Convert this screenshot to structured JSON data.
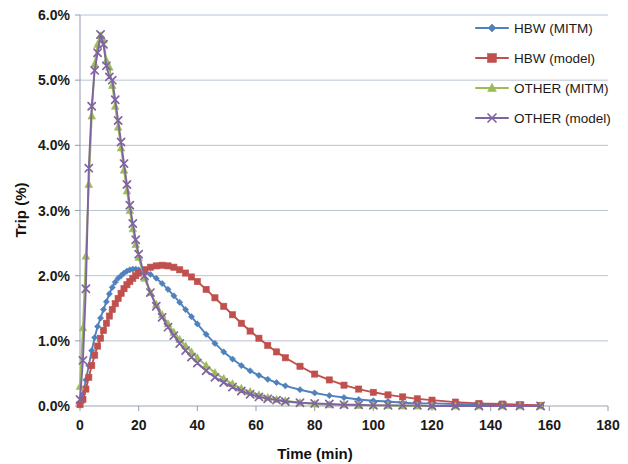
{
  "chart_data": {
    "type": "line",
    "title": "",
    "xlabel": "Time (min)",
    "ylabel": "Trip (%)",
    "xlim": [
      0,
      180
    ],
    "ylim": [
      0,
      6
    ],
    "xticks": [
      0,
      20,
      40,
      60,
      80,
      100,
      120,
      140,
      160,
      180
    ],
    "xtick_labels": [
      "0",
      "20",
      "40",
      "60",
      "80",
      "100",
      "120",
      "140",
      "160",
      "180"
    ],
    "yticks": [
      0,
      1,
      2,
      3,
      4,
      5,
      6
    ],
    "ytick_labels": [
      "0.0%",
      "1.0%",
      "2.0%",
      "3.0%",
      "4.0%",
      "5.0%",
      "6.0%"
    ],
    "grid": "horizontal",
    "legend_position": "top-right",
    "x_values": [
      0,
      1,
      2,
      3,
      4,
      5,
      6,
      7,
      8,
      9,
      10,
      11,
      12,
      13,
      14,
      15,
      16,
      17,
      18,
      19,
      20,
      22,
      24,
      26,
      28,
      30,
      32,
      34,
      36,
      38,
      40,
      43,
      46,
      49,
      52,
      55,
      58,
      61,
      64,
      67,
      70,
      75,
      80,
      85,
      90,
      95,
      100,
      105,
      110,
      115,
      120,
      128,
      136,
      144,
      150,
      157
    ],
    "series": [
      {
        "name": "HBW (MITM)",
        "color": "#4F81BD",
        "marker": "diamond",
        "values": [
          0.05,
          0.18,
          0.4,
          0.62,
          0.85,
          1.05,
          1.22,
          1.35,
          1.48,
          1.6,
          1.72,
          1.82,
          1.9,
          1.96,
          2.0,
          2.04,
          2.07,
          2.09,
          2.1,
          2.1,
          2.09,
          2.06,
          2.02,
          1.96,
          1.88,
          1.79,
          1.69,
          1.59,
          1.48,
          1.37,
          1.26,
          1.1,
          0.96,
          0.83,
          0.72,
          0.62,
          0.54,
          0.47,
          0.41,
          0.36,
          0.31,
          0.25,
          0.2,
          0.16,
          0.13,
          0.1,
          0.08,
          0.07,
          0.05,
          0.04,
          0.04,
          0.03,
          0.02,
          0.02,
          0.01,
          0.01
        ]
      },
      {
        "name": "HBW (model)",
        "color": "#C0504D",
        "marker": "square",
        "values": [
          0.02,
          0.1,
          0.26,
          0.44,
          0.62,
          0.78,
          0.92,
          1.04,
          1.16,
          1.27,
          1.38,
          1.48,
          1.57,
          1.65,
          1.73,
          1.8,
          1.86,
          1.91,
          1.96,
          2.0,
          2.04,
          2.09,
          2.13,
          2.15,
          2.16,
          2.15,
          2.13,
          2.09,
          2.04,
          1.98,
          1.91,
          1.79,
          1.66,
          1.53,
          1.4,
          1.27,
          1.15,
          1.04,
          0.93,
          0.83,
          0.74,
          0.61,
          0.49,
          0.4,
          0.32,
          0.26,
          0.21,
          0.17,
          0.14,
          0.11,
          0.09,
          0.06,
          0.04,
          0.03,
          0.02,
          0.01
        ]
      },
      {
        "name": "OTHER (MITM)",
        "color": "#9BBB59",
        "marker": "triangle",
        "values": [
          0.3,
          1.2,
          2.3,
          3.4,
          4.45,
          5.25,
          5.55,
          5.68,
          5.62,
          5.3,
          5.2,
          4.92,
          4.6,
          4.28,
          3.96,
          3.62,
          3.3,
          3.0,
          2.72,
          2.48,
          2.28,
          1.96,
          1.74,
          1.56,
          1.4,
          1.26,
          1.13,
          1.02,
          0.92,
          0.83,
          0.74,
          0.62,
          0.51,
          0.42,
          0.34,
          0.27,
          0.22,
          0.17,
          0.13,
          0.1,
          0.08,
          0.05,
          0.03,
          0.02,
          0.02,
          0.01,
          0.01,
          0.01,
          0.0,
          0.0,
          0.0,
          0.0,
          0.0,
          0.0,
          0.0,
          0.0
        ]
      },
      {
        "name": "OTHER (model)",
        "color": "#8064A2",
        "marker": "x",
        "values": [
          0.1,
          0.7,
          1.8,
          3.65,
          4.6,
          5.15,
          5.42,
          5.7,
          5.55,
          5.22,
          5.05,
          5.0,
          4.7,
          4.38,
          4.05,
          3.72,
          3.4,
          3.08,
          2.8,
          2.55,
          2.33,
          2.0,
          1.74,
          1.53,
          1.36,
          1.21,
          1.08,
          0.96,
          0.85,
          0.75,
          0.66,
          0.54,
          0.44,
          0.36,
          0.29,
          0.23,
          0.18,
          0.14,
          0.11,
          0.09,
          0.07,
          0.05,
          0.04,
          0.03,
          0.02,
          0.02,
          0.01,
          0.01,
          0.01,
          0.01,
          0.0,
          0.0,
          0.0,
          0.0,
          0.0,
          0.0
        ]
      }
    ]
  },
  "legend": {
    "items": [
      {
        "label": "HBW (MITM)"
      },
      {
        "label": "HBW (model)"
      },
      {
        "label": "OTHER (MITM)"
      },
      {
        "label": "OTHER (model)"
      }
    ]
  },
  "axes": {
    "x_title": "Time (min)",
    "y_title": "Trip (%)"
  }
}
